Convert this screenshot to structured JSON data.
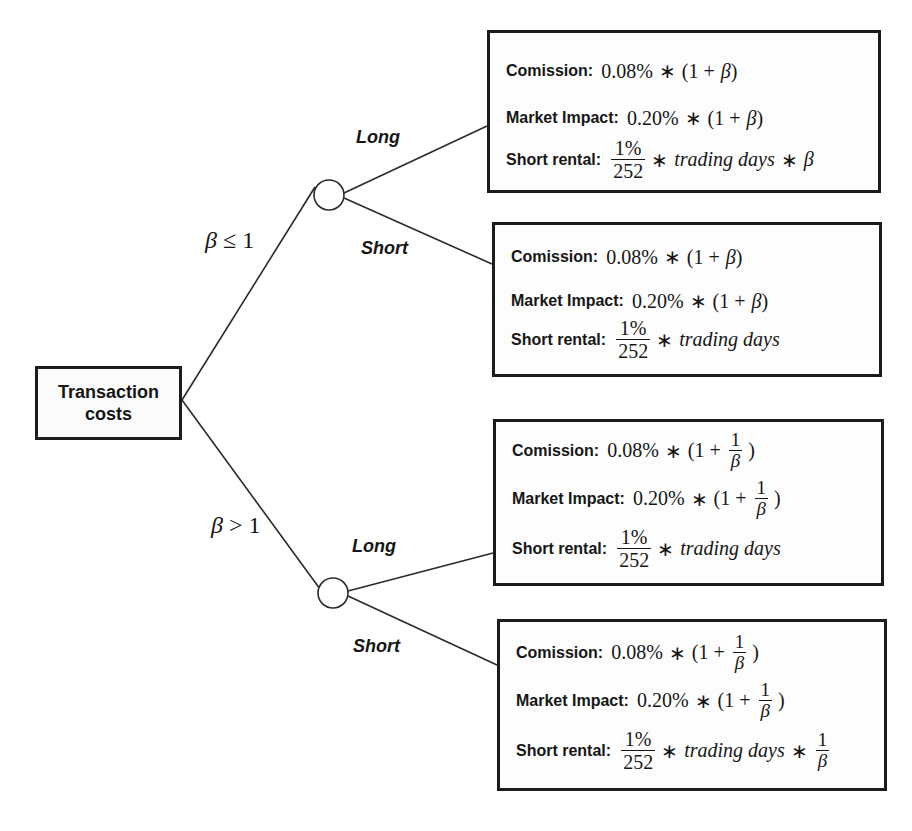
{
  "root": {
    "line1": "Transaction",
    "line2": "costs"
  },
  "conditions": {
    "upper": {
      "beta": "β",
      "op": "≤",
      "value": "1"
    },
    "lower": {
      "beta": "β",
      "op": ">",
      "value": "1"
    }
  },
  "branches": {
    "upper_long": "Long",
    "upper_short": "Short",
    "lower_long": "Long",
    "lower_short": "Short"
  },
  "labels": {
    "commission": "Comission:",
    "market_impact": "Market Impact:",
    "short_rental": "Short rental:"
  },
  "math": {
    "commission_rate": "0.08%",
    "market_impact_rate": "0.20%",
    "times": "∗",
    "open": "(1 +",
    "close": ")",
    "beta": "β",
    "one": "1",
    "rental_num": "1%",
    "rental_den": "252",
    "trading_days": "trading days"
  },
  "leaves": [
    {
      "id": "beta-le-1-long",
      "commission": "0.08% ∗ (1 + β)",
      "market_impact": "0.20% ∗ (1 + β)",
      "short_rental": "1%/252 ∗ trading days ∗ β"
    },
    {
      "id": "beta-le-1-short",
      "commission": "0.08% ∗ (1 + β)",
      "market_impact": "0.20% ∗ (1 + β)",
      "short_rental": "1%/252 ∗ trading days"
    },
    {
      "id": "beta-gt-1-long",
      "commission": "0.08% ∗ (1 + 1/β)",
      "market_impact": "0.20% ∗ (1 + 1/β)",
      "short_rental": "1%/252 ∗ trading days"
    },
    {
      "id": "beta-gt-1-short",
      "commission": "0.08% ∗ (1 + 1/β)",
      "market_impact": "0.20% ∗ (1 + 1/β)",
      "short_rental": "1%/252 ∗ trading days ∗ 1/β"
    }
  ],
  "colors": {
    "ink": "#161616",
    "border": "#1c1c1c",
    "background": "#ffffff"
  }
}
